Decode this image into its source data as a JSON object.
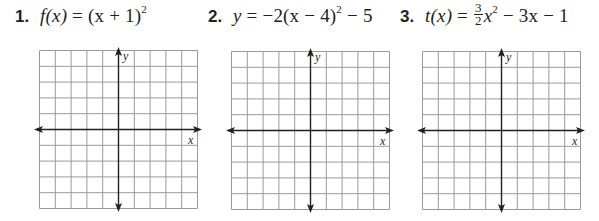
{
  "problems": [
    {
      "number": "1.",
      "equation_text": "f(x) = (x + 1)^2",
      "eq_parts": {
        "lhs": "f(x)",
        "eq": " = ",
        "rhs": "(x + 1)",
        "exp": "2",
        "tail": ""
      },
      "grid": {
        "cols": 10,
        "rows": 10,
        "x_axis_label": "x",
        "y_axis_label": "y"
      }
    },
    {
      "number": "2.",
      "equation_text": "y = −2(x − 4)^2 − 5",
      "eq_parts": {
        "lhs": "y",
        "eq": " = ",
        "rhs": "−2(x − 4)",
        "exp": "2",
        "tail": " − 5"
      },
      "grid": {
        "cols": 10,
        "rows": 10,
        "x_axis_label": "x",
        "y_axis_label": "y"
      }
    },
    {
      "number": "3.",
      "equation_text": "t(x) = (3/2)x^2 − 3x − 1",
      "eq_parts": {
        "lhs": "t(x)",
        "eq": " = ",
        "frac_num": "3",
        "frac_den": "2",
        "rhs": "x",
        "exp": "2",
        "tail": " − 3x − 1"
      },
      "grid": {
        "cols": 10,
        "rows": 10,
        "x_axis_label": "x",
        "y_axis_label": "y"
      }
    }
  ],
  "colors": {
    "text": "#231f20",
    "grid_line": "#9a9a9a",
    "axis": "#231f20"
  }
}
